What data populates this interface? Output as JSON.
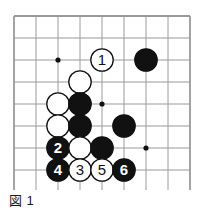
{
  "figure": {
    "caption_label": "図",
    "caption_number": "1"
  },
  "colors": {
    "black_stone": "#111111",
    "white_stone": "#ffffff",
    "stone_outline": "#111111",
    "grid_line": "#9a9a9a",
    "border_line": "#9a9a9a",
    "background": "#ffffff",
    "star_point": "#111111",
    "label_on_black": "#ffffff",
    "label_on_white": "#111111"
  },
  "board": {
    "type": "go-board-diagram",
    "origin_x": 14,
    "origin_y": 16,
    "cell": 22,
    "cols": 8,
    "rows": 8,
    "star_points": [
      {
        "col": 2,
        "row": 2
      },
      {
        "col": 4,
        "row": 4
      },
      {
        "col": 6,
        "row": 6
      }
    ],
    "stones": [
      {
        "col": 4,
        "row": 2,
        "color": "white",
        "label": "1"
      },
      {
        "col": 6,
        "row": 2,
        "color": "black",
        "label": ""
      },
      {
        "col": 3,
        "row": 3,
        "color": "white",
        "label": ""
      },
      {
        "col": 2,
        "row": 4,
        "color": "white",
        "label": ""
      },
      {
        "col": 3,
        "row": 4,
        "color": "black",
        "label": ""
      },
      {
        "col": 2,
        "row": 5,
        "color": "white",
        "label": ""
      },
      {
        "col": 3,
        "row": 5,
        "color": "black",
        "label": ""
      },
      {
        "col": 5,
        "row": 5,
        "color": "black",
        "label": ""
      },
      {
        "col": 2,
        "row": 6,
        "color": "black",
        "label": "2"
      },
      {
        "col": 3,
        "row": 6,
        "color": "white",
        "label": ""
      },
      {
        "col": 4,
        "row": 6,
        "color": "black",
        "label": ""
      },
      {
        "col": 2,
        "row": 7,
        "color": "black",
        "label": "4"
      },
      {
        "col": 3,
        "row": 7,
        "color": "white",
        "label": "3"
      },
      {
        "col": 4,
        "row": 7,
        "color": "white",
        "label": "5"
      },
      {
        "col": 5,
        "row": 7,
        "color": "black",
        "label": "6"
      }
    ]
  }
}
